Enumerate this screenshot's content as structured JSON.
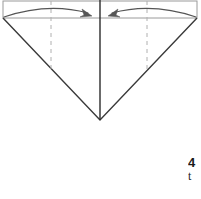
{
  "figure": {
    "colors": {
      "outline_dark": "#3a3a3a",
      "outline_light": "#9a9a9a",
      "dashed_fold": "#b0b0b0",
      "center_line": "#2b2b2b",
      "arrow": "#555555",
      "background": "#ffffff"
    },
    "shapes": {
      "top_rectangle": {
        "name": "top-edge-band",
        "x": 3,
        "y": 1,
        "width": 194,
        "height": 17
      },
      "triangle": {
        "name": "v-fold-triangle",
        "left_point": [
          3,
          18
        ],
        "right_point": [
          197,
          18
        ],
        "bottom_vertex": [
          100,
          120
        ]
      },
      "center_line": {
        "name": "center-crease",
        "x": 100,
        "y_start": 0,
        "y_end": 120
      },
      "dashed_fold_left": {
        "name": "left-fold-line",
        "x": 51,
        "y_start": 1,
        "y_end": 69
      },
      "dashed_fold_right": {
        "name": "right-fold-line",
        "x": 147,
        "y_start": 1,
        "y_end": 69
      }
    },
    "arrows": [
      {
        "name": "fold-arrow-left",
        "direction": "right",
        "start": [
          4,
          17
        ],
        "control": [
          48,
          2
        ],
        "end": [
          92,
          16
        ]
      },
      {
        "name": "fold-arrow-right",
        "direction": "left",
        "start": [
          196,
          17
        ],
        "control": [
          152,
          2
        ],
        "end": [
          108,
          16
        ]
      }
    ]
  },
  "caption": {
    "step_number": "4",
    "text": "t"
  }
}
